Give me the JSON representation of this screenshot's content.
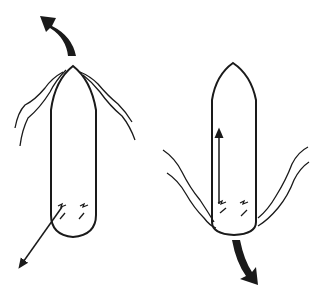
{
  "diagram": {
    "colors": {
      "stroke": "#1a1a1a",
      "background": "#ffffff"
    },
    "left_figure": {
      "label": "",
      "rotation_arrow": "curved-arrow-up-left",
      "force_arrow": "arrow-down-left",
      "propeller_marks": 2
    },
    "right_figure": {
      "label": "",
      "rotation_arrow": "curved-arrow-down-right",
      "force_arrow": "arrow-up",
      "propeller_marks": 2
    }
  }
}
